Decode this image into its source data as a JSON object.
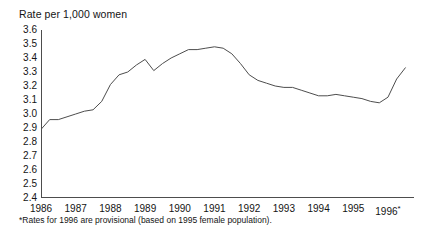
{
  "chart_data": {
    "type": "line",
    "title": "Rate per 1,000 women",
    "xlabel": "",
    "ylabel": "Rate per 1,000 women",
    "ylim": [
      2.4,
      3.6
    ],
    "xlim": [
      1986.0,
      1996.75
    ],
    "grid": false,
    "legend": null,
    "y_ticks": [
      "3.6",
      "3.5",
      "3.4",
      "3.3",
      "3.2",
      "3.1",
      "3.0",
      "2.9",
      "2.8",
      "2.7",
      "2.6",
      "2.5",
      "2.4"
    ],
    "y_tick_values": [
      3.6,
      3.5,
      3.4,
      3.3,
      3.2,
      3.1,
      3.0,
      2.9,
      2.8,
      2.7,
      2.6,
      2.5,
      2.4
    ],
    "x_ticks": [
      "1986",
      "1987",
      "1988",
      "1989",
      "1990",
      "1991",
      "1992",
      "1993",
      "1994",
      "1995",
      "1996"
    ],
    "x_tick_values": [
      1986,
      1987,
      1988,
      1989,
      1990,
      1991,
      1992,
      1993,
      1994,
      1995,
      1996
    ],
    "x_last_tick_asterisk": "*",
    "series": [
      {
        "name": "Rate per 1,000 women",
        "color": "#4d4d4d",
        "x": [
          1986.0,
          1986.25,
          1986.5,
          1986.75,
          1987.0,
          1987.25,
          1987.5,
          1987.75,
          1988.0,
          1988.25,
          1988.5,
          1988.75,
          1989.0,
          1989.25,
          1989.5,
          1989.75,
          1990.0,
          1990.25,
          1990.5,
          1990.75,
          1991.0,
          1991.25,
          1991.5,
          1991.75,
          1992.0,
          1992.25,
          1992.5,
          1992.75,
          1993.0,
          1993.25,
          1993.5,
          1993.75,
          1994.0,
          1994.25,
          1994.5,
          1994.75,
          1995.0,
          1995.25,
          1995.5,
          1995.75,
          1996.0,
          1996.25,
          1996.5
        ],
        "y": [
          2.89,
          2.96,
          2.96,
          2.98,
          3.0,
          3.02,
          3.03,
          3.09,
          3.21,
          3.28,
          3.3,
          3.35,
          3.39,
          3.31,
          3.36,
          3.4,
          3.43,
          3.46,
          3.46,
          3.47,
          3.48,
          3.47,
          3.43,
          3.36,
          3.28,
          3.24,
          3.22,
          3.2,
          3.19,
          3.19,
          3.17,
          3.15,
          3.13,
          3.13,
          3.14,
          3.13,
          3.12,
          3.11,
          3.09,
          3.08,
          3.12,
          3.25,
          3.33
        ]
      }
    ],
    "annotations": [
      {
        "text": "*Rates for 1996 are provisional (based on 1995 female population).",
        "position": "below-axis"
      }
    ],
    "axis_color": "#4d4d4d",
    "line_color": "#4d4d4d"
  },
  "footnote": {
    "text": "*Rates for 1996 are provisional (based on 1995 female population)."
  }
}
